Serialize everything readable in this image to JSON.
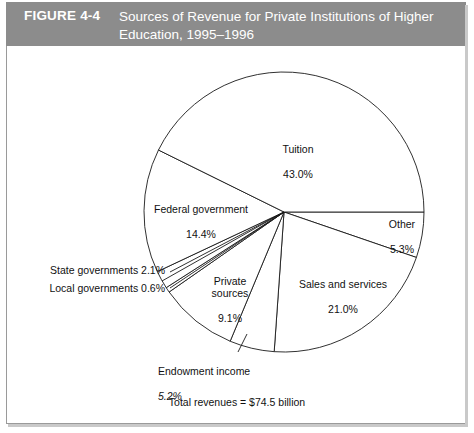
{
  "figure": {
    "number_label": "FIGURE 4-4",
    "title": "Sources of Revenue for Private Institutions of Higher\nEducation, 1995–1996",
    "total_caption": "Total revenues = $74.5 billion",
    "band_color": "#8c8c8c",
    "band_text_color": "#ffffff",
    "frame_color": "#9a9a9a"
  },
  "chart_data": {
    "type": "pie",
    "title": "Sources of Revenue for Private Institutions of Higher Education, 1995–1996",
    "subtitle": "Total revenues = $74.5 billion",
    "unit": "percent",
    "total_value": "$74.5 billion",
    "start_angle_deg": 0,
    "direction": "clockwise",
    "categories": [
      "Other",
      "Sales and services",
      "Endowment income",
      "Private sources",
      "Local governments",
      "State governments",
      "Federal government",
      "Tuition"
    ],
    "values": [
      5.3,
      21.0,
      5.2,
      9.1,
      0.6,
      2.1,
      14.4,
      43.0
    ],
    "slices": [
      {
        "name": "Other",
        "value": 5.3,
        "label": "Other",
        "pct_text": "5.3%"
      },
      {
        "name": "Sales and services",
        "value": 21.0,
        "label": "Sales and services",
        "pct_text": "21.0%"
      },
      {
        "name": "Endowment income",
        "value": 5.2,
        "label": "Endowment income",
        "pct_text": "5.2%"
      },
      {
        "name": "Private sources",
        "value": 9.1,
        "label": "Private\nsources",
        "pct_text": "9.1%"
      },
      {
        "name": "Local governments",
        "value": 0.6,
        "label": "Local governments",
        "pct_text": "0.6%"
      },
      {
        "name": "State governments",
        "value": 2.1,
        "label": "State governments",
        "pct_text": "2.1%"
      },
      {
        "name": "Federal government",
        "value": 14.4,
        "label": "Federal government",
        "pct_text": "14.4%"
      },
      {
        "name": "Tuition",
        "value": 43.0,
        "label": "Tuition",
        "pct_text": "43.0%"
      }
    ],
    "legend": "none",
    "grid": false,
    "fill_color": "#ffffff",
    "stroke_color": "#1a1a1a"
  },
  "labels": {
    "tuition": {
      "name": "Tuition",
      "pct": "43.0%"
    },
    "other": {
      "name": "Other",
      "pct": "5.3%"
    },
    "sales_services": {
      "name": "Sales and services",
      "pct": "21.0%"
    },
    "endowment": {
      "name": "Endowment income",
      "pct": "5.2%"
    },
    "private_sources": {
      "name": "Private\nsources",
      "pct": "9.1%"
    },
    "local_gov": {
      "text": "Local governments 0.6%"
    },
    "state_gov": {
      "text": "State governments 2.1%"
    },
    "federal_gov": {
      "name": "Federal government",
      "pct": "14.4%"
    }
  }
}
